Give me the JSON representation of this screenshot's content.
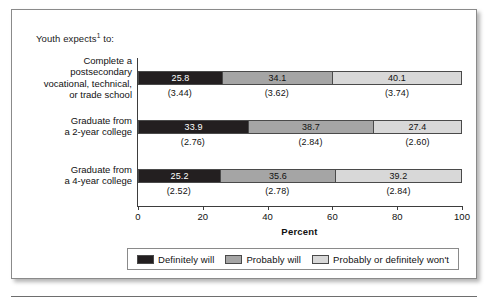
{
  "figure": {
    "header_note": "Youth expects",
    "header_note_superscript": "1",
    "header_note_tail": " to:"
  },
  "chart_data": {
    "type": "bar",
    "subtype": "stacked-horizontal-100",
    "xlabel": "Percent",
    "ylabel": "",
    "xlim": [
      0,
      100
    ],
    "xticks": [
      0,
      20,
      40,
      60,
      80,
      100
    ],
    "xtick_labels": [
      "0",
      "20",
      "40",
      "60",
      "80",
      "100"
    ],
    "grid": false,
    "legend_position": "bottom",
    "categories": [
      "Complete a postsecondary vocational, technical, or trade school",
      "Graduate from a 2-year college",
      "Graduate from a 4-year college"
    ],
    "category_label_lines": [
      [
        "Complete a",
        "postsecondary",
        "vocational, technical,",
        "or trade school"
      ],
      [
        "Graduate from",
        "a 2-year college"
      ],
      [
        "Graduate from",
        "a 4-year college"
      ]
    ],
    "series": [
      {
        "name": "Definitely will",
        "color": "#231f20",
        "values": [
          25.8,
          33.9,
          25.2
        ],
        "value_labels": [
          "25.8",
          "33.9",
          "25.2"
        ],
        "standard_errors": [
          3.44,
          2.76,
          2.52
        ],
        "standard_error_labels": [
          "(3.44)",
          "(2.76)",
          "(2.52)"
        ]
      },
      {
        "name": "Probably will",
        "color": "#a5a5a5",
        "values": [
          34.1,
          38.7,
          35.6
        ],
        "value_labels": [
          "34.1",
          "38.7",
          "35.6"
        ],
        "standard_errors": [
          3.62,
          2.84,
          2.78
        ],
        "standard_error_labels": [
          "(3.62)",
          "(2.84)",
          "(2.78)"
        ]
      },
      {
        "name": "Probably or definitely won't",
        "color": "#d8d8d8",
        "values": [
          40.1,
          27.4,
          39.2
        ],
        "value_labels": [
          "40.1",
          "27.4",
          "39.2"
        ],
        "standard_errors": [
          3.74,
          2.6,
          2.84
        ],
        "standard_error_labels": [
          "(3.74)",
          "(2.60)",
          "(2.84)"
        ]
      }
    ]
  },
  "legend": {
    "items": [
      {
        "label": "Definitely will",
        "color": "#231f20"
      },
      {
        "label": "Probably will",
        "color": "#a5a5a5"
      },
      {
        "label": "Probably or definitely won't",
        "color": "#d8d8d8"
      }
    ]
  },
  "axis": {
    "title": "Percent",
    "ticks": [
      "0",
      "20",
      "40",
      "60",
      "80",
      "100"
    ]
  }
}
